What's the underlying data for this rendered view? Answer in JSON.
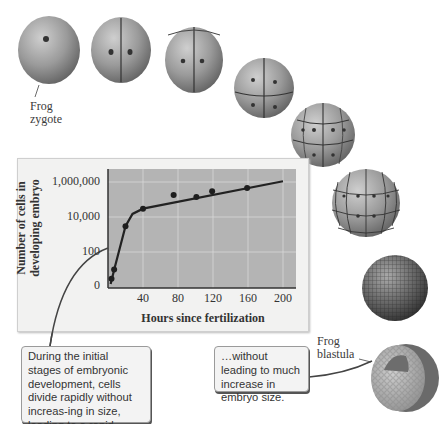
{
  "labels": {
    "zygote": [
      "Frog",
      "zygote"
    ],
    "blastula": [
      "Frog",
      "blastula"
    ]
  },
  "callouts": {
    "left": "During the initial stages of embryonic development, cells divide rapidly without increas-ing in size, leading to a rapid increase in cell number…",
    "right": "…without leading to much increase in embryo size."
  },
  "stages": [
    {
      "name": "zygote",
      "cells": 1
    },
    {
      "name": "2-cell",
      "cells": 2
    },
    {
      "name": "4-cell",
      "cells": 4
    },
    {
      "name": "8-cell",
      "cells": 8
    },
    {
      "name": "16-cell",
      "cells": 16
    },
    {
      "name": "32-cell",
      "cells": 32
    },
    {
      "name": "morula",
      "cells": "many"
    },
    {
      "name": "blastula",
      "cells": "many"
    }
  ],
  "chart_data": {
    "type": "line",
    "title": "",
    "xlabel": "Hours since fertilization",
    "ylabel": "Number of cells in developing embryo",
    "yscale": "log",
    "xlim": [
      0,
      200
    ],
    "ylim": [
      1,
      1000000
    ],
    "xticks": [
      40,
      80,
      120,
      160,
      200
    ],
    "yticks": [
      {
        "value": 1,
        "label": "0"
      },
      {
        "value": 100,
        "label": "100"
      },
      {
        "value": 10000,
        "label": "10,000"
      },
      {
        "value": 1000000,
        "label": "1,000,000"
      }
    ],
    "grid": true,
    "points": [
      {
        "x": 4,
        "y": 3
      },
      {
        "x": 7,
        "y": 10
      },
      {
        "x": 20,
        "y": 3000
      },
      {
        "x": 40,
        "y": 30000
      },
      {
        "x": 75,
        "y": 180000
      },
      {
        "x": 101,
        "y": 140000
      },
      {
        "x": 119,
        "y": 300000
      },
      {
        "x": 159,
        "y": 450000
      }
    ],
    "trend_line": [
      {
        "x": 3,
        "y": 1.5
      },
      {
        "x": 8,
        "y": 15
      },
      {
        "x": 20,
        "y": 3000
      },
      {
        "x": 28,
        "y": 15000
      },
      {
        "x": 40,
        "y": 30000
      },
      {
        "x": 200,
        "y": 1100000
      }
    ]
  }
}
